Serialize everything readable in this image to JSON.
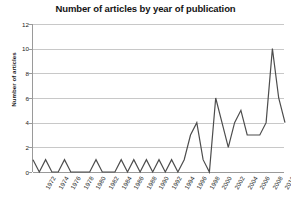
{
  "chart_data": {
    "type": "line",
    "title": "Number of articles by year of publication",
    "xlabel": "",
    "ylabel": "Number of articles",
    "ylim": [
      0,
      12
    ],
    "yticks": [
      0,
      2,
      4,
      6,
      8,
      10,
      12
    ],
    "xlim": [
      1972,
      2012
    ],
    "xtick_labels": [
      "1972",
      "1974",
      "1976",
      "1978",
      "1980",
      "1982",
      "1984",
      "1986",
      "1988",
      "1990",
      "1992",
      "1994",
      "1996",
      "1998",
      "2000",
      "2002",
      "2004",
      "2006",
      "2008",
      "2010",
      "2012"
    ],
    "grid": true,
    "legend": false,
    "x": [
      1972,
      1973,
      1974,
      1975,
      1976,
      1977,
      1978,
      1979,
      1980,
      1981,
      1982,
      1983,
      1984,
      1985,
      1986,
      1987,
      1988,
      1989,
      1990,
      1991,
      1992,
      1993,
      1994,
      1995,
      1996,
      1997,
      1998,
      1999,
      2000,
      2001,
      2002,
      2003,
      2004,
      2005,
      2006,
      2007,
      2008,
      2009,
      2010,
      2011,
      2012
    ],
    "values": [
      1,
      0,
      1,
      0,
      0,
      1,
      0,
      0,
      0,
      0,
      1,
      0,
      0,
      0,
      1,
      0,
      1,
      0,
      1,
      0,
      1,
      0,
      1,
      0,
      1,
      3,
      4,
      1,
      0,
      6,
      4,
      2,
      4,
      5,
      3,
      3,
      3,
      4,
      10,
      6,
      4
    ],
    "series_color": "#4d4d4d",
    "grid_color": "#c8c8c8",
    "axis_color": "#9a9a9a"
  }
}
